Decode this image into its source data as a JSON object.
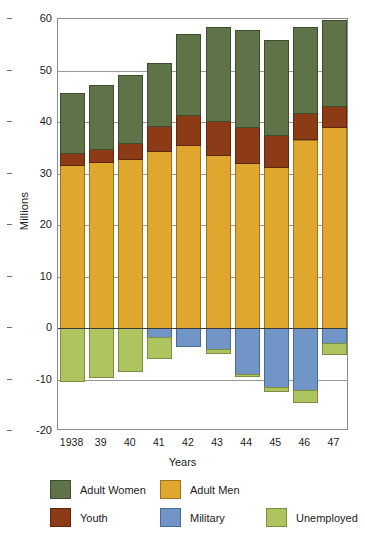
{
  "chart_data": {
    "type": "bar",
    "subtype": "stacked-diverging",
    "title": "",
    "xlabel": "Years",
    "ylabel": "Millions",
    "ylim": [
      -20,
      60
    ],
    "yticks": [
      60,
      50,
      40,
      30,
      20,
      10,
      0,
      -10,
      -20
    ],
    "ytick_labels": [
      "60",
      "50",
      "40",
      "30",
      "20",
      "10",
      "0",
      "-10",
      "-20"
    ],
    "grid": true,
    "legend_position": "below",
    "categories": [
      "1938",
      "39",
      "40",
      "41",
      "42",
      "43",
      "44",
      "45",
      "46",
      "47"
    ],
    "series": [
      {
        "name": "Adult Men",
        "key": "men",
        "color": "#dfa72e",
        "direction": "up",
        "values": [
          31.6,
          32.2,
          32.9,
          34.3,
          35.5,
          33.6,
          32.1,
          31.3,
          36.6,
          39.0
        ]
      },
      {
        "name": "Youth",
        "key": "youth",
        "color": "#8d3a17",
        "direction": "up",
        "values": [
          2.3,
          2.6,
          3.0,
          5.0,
          5.8,
          6.6,
          7.0,
          6.2,
          5.1,
          4.2
        ]
      },
      {
        "name": "Adult Women",
        "key": "women",
        "color": "#5e7448",
        "direction": "up",
        "values": [
          11.7,
          12.3,
          13.2,
          12.2,
          15.8,
          18.3,
          18.8,
          18.5,
          16.8,
          16.6
        ]
      },
      {
        "name": "Military",
        "key": "military",
        "color": "#7195c6",
        "direction": "down",
        "values": [
          0.0,
          0.0,
          0.0,
          1.7,
          3.4,
          4.1,
          9.0,
          11.5,
          12.1,
          3.0
        ]
      },
      {
        "name": "Unemployed",
        "key": "unemp",
        "color": "#aec45f",
        "direction": "down",
        "values": [
          10.3,
          9.5,
          8.4,
          4.1,
          0.0,
          0.8,
          0.4,
          0.8,
          2.3,
          2.1
        ]
      }
    ],
    "totals_up": [
      45.6,
      47.1,
      49.1,
      51.5,
      57.1,
      58.5,
      57.9,
      56.0,
      58.5,
      59.8
    ],
    "totals_down": [
      10.3,
      9.5,
      8.4,
      5.8,
      3.4,
      4.9,
      9.4,
      12.3,
      14.4,
      5.1
    ]
  },
  "legend": {
    "items": [
      {
        "label": "Adult Women",
        "key": "women"
      },
      {
        "label": "Adult Men",
        "key": "men"
      },
      {
        "label": "Youth",
        "key": "youth"
      },
      {
        "label": "Military",
        "key": "military"
      },
      {
        "label": "Unemployed",
        "key": "unemp"
      }
    ]
  }
}
